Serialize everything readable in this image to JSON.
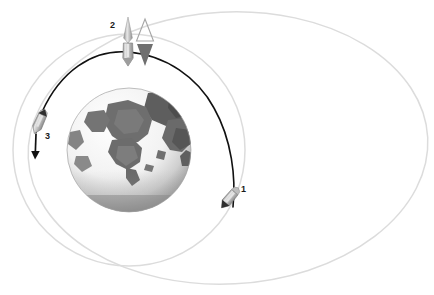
{
  "figure": {
    "background_color": "#ffffff",
    "width": 434,
    "height": 295
  },
  "labels": [
    {
      "id": "1",
      "text": "1",
      "x": 241,
      "y": 185,
      "meaning": "burn-point-1-departure"
    },
    {
      "id": "2",
      "text": "2",
      "x": 110,
      "y": 21,
      "meaning": "burn-point-2-apogee"
    },
    {
      "id": "3",
      "text": "3",
      "x": 45,
      "y": 132,
      "meaning": "burn-point-3-arrival"
    }
  ],
  "earth": {
    "name": "earth-globe",
    "center_x": 129,
    "center_y": 150,
    "radius": 62,
    "colors": {
      "ocean": "#ffffff",
      "land": "#6e6e6e",
      "land_dark": "#4a4a4a",
      "shadow": "#8f8f8f",
      "terminator": "#b4b4b4",
      "rim": "#9a9a9a"
    }
  },
  "orbits": [
    {
      "name": "circular-orbit",
      "type": "circle",
      "cx": 129,
      "cy": 150,
      "rx": 116,
      "ry": 116,
      "rotation": 0,
      "stroke": "#d8d8d8",
      "stroke_width": 1.4
    },
    {
      "name": "elliptical-orbit",
      "type": "ellipse",
      "cx": 228,
      "cy": 148,
      "rx": 200,
      "ry": 136,
      "rotation": -3,
      "stroke": "#d8d8d8",
      "stroke_width": 1.4
    }
  ],
  "transfer_arc": {
    "name": "transfer-trajectory",
    "stroke": "#111111",
    "stroke_width": 1.6,
    "from_label": "1",
    "via_label": "2",
    "to_label": "3"
  },
  "spacecraft": [
    {
      "name": "spacecraft-marker-1",
      "x": 229,
      "y": 200,
      "rotation": 38,
      "label": "1",
      "body_fill": "#c9c9c9",
      "nose_fill": "#3a3a3a"
    },
    {
      "name": "spacecraft-marker-2",
      "x": 128,
      "y": 52,
      "rotation": 0,
      "label": "2",
      "body_fill": "#c9c9c9",
      "nose_fill": "#3a3a3a"
    },
    {
      "name": "spacecraft-marker-3",
      "x": 39,
      "y": 122,
      "rotation": 22,
      "label": "3",
      "body_fill": "#c9c9c9",
      "nose_fill": "#3a3a3a"
    }
  ],
  "burn_indicators": [
    {
      "name": "thrust-spike-up",
      "style": "filled-spike-up",
      "fill": "#a8a8a8",
      "x": 128,
      "y": 18
    },
    {
      "name": "delta-v-triangle-outline-up",
      "style": "outline-triangle-up",
      "stroke": "#9a9a9a",
      "x": 145,
      "y": 20
    },
    {
      "name": "delta-v-triangle-filled-down",
      "style": "filled-triangle-down",
      "fill": "#6b6b6b",
      "x": 145,
      "y": 45
    }
  ],
  "velocity_arrow": {
    "name": "velocity-arrow-3",
    "stroke": "#111111",
    "stroke_width": 1.6,
    "from_x": 36,
    "from_y": 133,
    "to_x": 35,
    "to_y": 160
  }
}
